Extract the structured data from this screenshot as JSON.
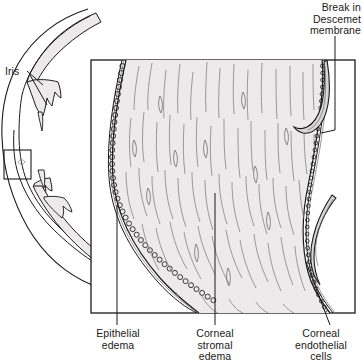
{
  "figure": {
    "type": "anatomical-illustration",
    "colors": {
      "ink": "#1a1a1a",
      "stroma_fill": "#eceaea",
      "cornea_band_fill": "#ebe9e9",
      "fiber": "#8d8d8d",
      "background": "#ffffff"
    }
  },
  "labels": {
    "break_descemet": "Break in\nDescemet\nmembrane",
    "iris": "Iris",
    "epithelial_edema": "Epithelial\nedema",
    "corneal_stromal_edema": "Corneal\nstromal\nedema",
    "corneal_endothelial_cells": "Corneal\nendothelial\ncells"
  },
  "regions": {
    "callout_box": "magnification-region-rectangle",
    "magnified_panel": "corneal-cross-section-panel"
  }
}
